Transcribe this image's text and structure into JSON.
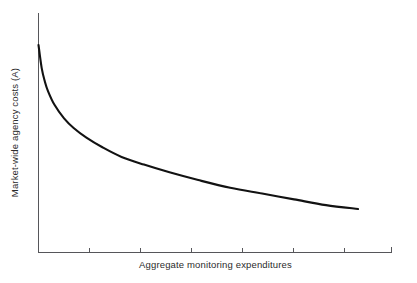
{
  "chart_data": {
    "type": "line",
    "title": "",
    "subtitle": "",
    "xlabel": "Aggregate monitoring expenditures",
    "ylabel": "Market-wide agency costs (A)",
    "legend": [],
    "legend_position": "none",
    "grid": false,
    "xlim": [
      0,
      100
    ],
    "ylim": [
      0,
      100
    ],
    "x_tick_labels": [],
    "y_tick_labels": [],
    "x_tick_count": 7,
    "annotations": [],
    "series": [
      {
        "name": "Market-wide agency costs",
        "x": [
          0,
          1,
          2,
          3,
          5,
          8,
          11,
          15,
          20,
          26,
          33,
          41,
          50,
          60,
          70,
          80,
          90,
          100
        ],
        "values": [
          100,
          88,
          81,
          76,
          69,
          62,
          57,
          52,
          47,
          42,
          38,
          34,
          30,
          26,
          23,
          20,
          17,
          15
        ]
      }
    ]
  },
  "figure": {
    "axis_color": "#56565a",
    "curve_color": "#121212",
    "text_color": "#2b2b2b",
    "background_color": "#ffffff"
  }
}
